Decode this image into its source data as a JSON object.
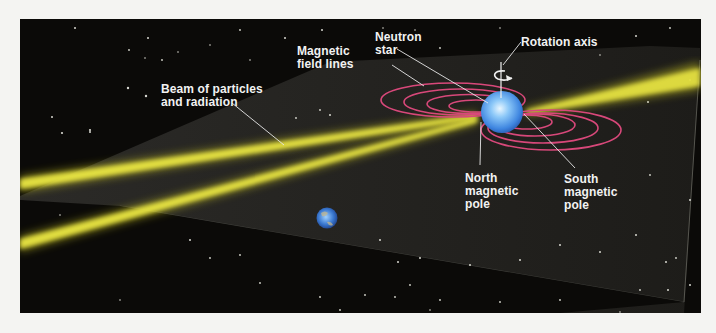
{
  "figure": {
    "colors": {
      "background": "#f4f4f2",
      "space": "#0b0a08",
      "plane": "#3a3a36",
      "beam": "#e6e23a",
      "field_lines": "#d8487a",
      "star": "#5aa8f0",
      "label_text": "#f2f2f2",
      "leader_lines": "#e8e8e8"
    },
    "labels": {
      "beam": "Beam of particles\nand radiation",
      "field_lines": "Magnetic\nfield lines",
      "neutron_star": "Neutron\nstar",
      "rotation_axis": "Rotation axis",
      "north_pole": "North\nmagnetic\npole",
      "south_pole": "South\nmagnetic\npole"
    },
    "objects": {
      "neutron_star": "neutron-star-sphere",
      "earth": "earth-globe",
      "rotation_arrow": "counterclockwise-rotation-arrow"
    }
  }
}
